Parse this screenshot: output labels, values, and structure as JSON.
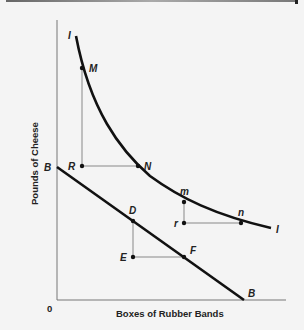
{
  "diagram": {
    "y_axis_label": "Pounds of Cheese",
    "x_axis_label": "Boxes of Rubber Bands",
    "origin_label": "0",
    "indifference_curve": {
      "label_start": "I",
      "label_end": "I",
      "points": [
        {
          "label": "M"
        },
        {
          "label": "N"
        },
        {
          "label": "m"
        },
        {
          "label": "n"
        }
      ],
      "corners": [
        {
          "label": "R"
        },
        {
          "label": "r"
        }
      ]
    },
    "budget_line": {
      "label_start": "B",
      "label_end": "B",
      "points": [
        {
          "label": "D"
        },
        {
          "label": "F"
        }
      ],
      "corners": [
        {
          "label": "E"
        }
      ]
    },
    "colors": {
      "curve": "#111111",
      "guide": "#888888",
      "axis": "#666666"
    }
  }
}
